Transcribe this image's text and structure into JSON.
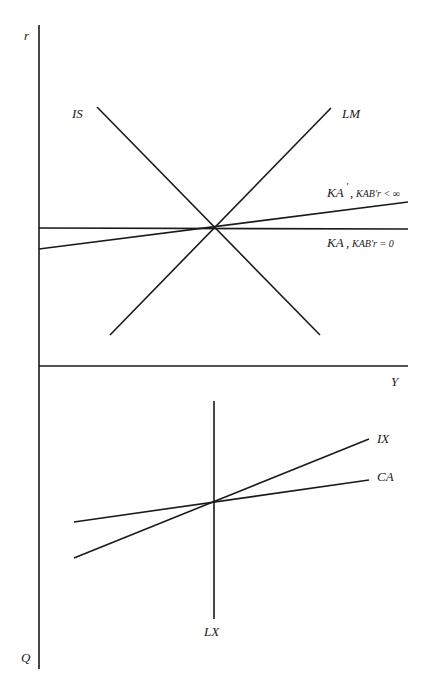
{
  "diagram": {
    "axes": {
      "vertical_top_label": "r",
      "vertical_bottom_label": "Q",
      "horizontal_label": "Y"
    },
    "upper_panel": {
      "curves": [
        {
          "id": "IS",
          "label": "IS"
        },
        {
          "id": "LM",
          "label": "LM"
        },
        {
          "id": "KA_prime",
          "label_main": "KA",
          "label_prime": "′",
          "label_sep": ",",
          "label_cond": "KAB′r < ∞"
        },
        {
          "id": "KA",
          "label_main": "KA",
          "label_sep": ",",
          "label_cond": "KAB′r = 0"
        }
      ]
    },
    "lower_panel": {
      "curves": [
        {
          "id": "IX",
          "label": "IX"
        },
        {
          "id": "CA",
          "label": "CA"
        },
        {
          "id": "LX",
          "label": "LX"
        }
      ]
    }
  }
}
